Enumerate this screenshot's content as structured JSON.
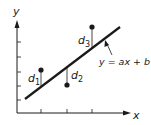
{
  "diagram": {
    "axes": {
      "x_label": "x",
      "y_label": "y"
    },
    "line": {
      "equation": "y = ax + b"
    },
    "residuals": [
      {
        "name": "d",
        "index": "1"
      },
      {
        "name": "d",
        "index": "2"
      },
      {
        "name": "d",
        "index": "3"
      }
    ],
    "colors": {
      "stroke": "#1a1a1a",
      "background": "#ffffff"
    }
  }
}
